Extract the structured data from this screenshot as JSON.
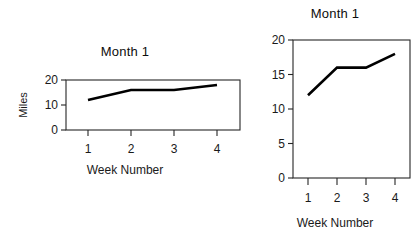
{
  "figure": {
    "background_color": "#ffffff",
    "ink_color": "#000000"
  },
  "charts": [
    {
      "id": "chart-left",
      "title": "Month 1",
      "xlabel": "Week Number",
      "ylabel": "Miles",
      "ytick_labels": [
        "0",
        "10",
        "20"
      ],
      "xtick_labels": [
        "1",
        "2",
        "3",
        "4"
      ]
    },
    {
      "id": "chart-right",
      "title": "Month 1",
      "xlabel": "Week Number",
      "ylabel": "Miles",
      "ytick_labels": [
        "0",
        "5",
        "10",
        "15",
        "20"
      ],
      "xtick_labels": [
        "1",
        "2",
        "3",
        "4"
      ]
    }
  ],
  "chart_data": [
    {
      "type": "line",
      "title": "Month 1",
      "xlabel": "Week Number",
      "ylabel": "Miles",
      "x": [
        1,
        2,
        3,
        4
      ],
      "values": [
        12,
        16,
        16,
        18
      ],
      "xtick_labels": [
        "1",
        "2",
        "3",
        "4"
      ],
      "ytick_labels": [
        "0",
        "10",
        "20"
      ],
      "yticks": [
        0,
        10,
        20
      ],
      "xlim": [
        0.6,
        4.4
      ],
      "ylim": [
        0,
        20
      ],
      "grid": false,
      "legend": false,
      "line_color": "#000000",
      "markers": false,
      "note": "Wide, vertically compressed panel - same data as right panel"
    },
    {
      "type": "line",
      "title": "Month 1",
      "xlabel": "Week Number",
      "ylabel": "Miles",
      "x": [
        1,
        2,
        3,
        4
      ],
      "values": [
        12,
        16,
        16,
        18
      ],
      "xtick_labels": [
        "1",
        "2",
        "3",
        "4"
      ],
      "ytick_labels": [
        "0",
        "5",
        "10",
        "15",
        "20"
      ],
      "yticks": [
        0,
        5,
        10,
        15,
        20
      ],
      "xlim": [
        0.6,
        4.4
      ],
      "ylim": [
        0,
        20
      ],
      "grid": false,
      "legend": false,
      "line_color": "#000000",
      "markers": false,
      "note": "Tall, vertically expanded panel - same data as left panel"
    }
  ]
}
